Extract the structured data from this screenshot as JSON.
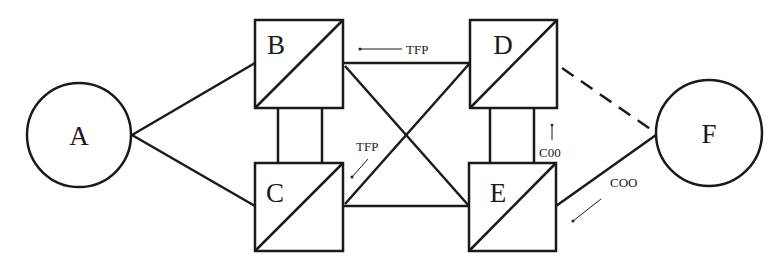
{
  "diagram": {
    "type": "network-topology",
    "nodes": [
      {
        "id": "A",
        "label": "A",
        "shape": "circle"
      },
      {
        "id": "B",
        "label": "B",
        "shape": "square-diagonal"
      },
      {
        "id": "C",
        "label": "C",
        "shape": "square-diagonal"
      },
      {
        "id": "D",
        "label": "D",
        "shape": "square-diagonal"
      },
      {
        "id": "E",
        "label": "E",
        "shape": "square-diagonal"
      },
      {
        "id": "F",
        "label": "F",
        "shape": "circle"
      }
    ],
    "edges": [
      {
        "from": "A",
        "to": "B",
        "style": "solid"
      },
      {
        "from": "A",
        "to": "C",
        "style": "solid"
      },
      {
        "from": "B",
        "to": "C",
        "style": "double-solid"
      },
      {
        "from": "B",
        "to": "D",
        "style": "solid"
      },
      {
        "from": "B",
        "to": "E",
        "style": "solid"
      },
      {
        "from": "C",
        "to": "D",
        "style": "solid"
      },
      {
        "from": "C",
        "to": "E",
        "style": "solid"
      },
      {
        "from": "D",
        "to": "E",
        "style": "double-solid"
      },
      {
        "from": "D",
        "to": "F",
        "style": "dashed"
      },
      {
        "from": "E",
        "to": "F",
        "style": "solid"
      }
    ],
    "annotations": [
      {
        "text": "TFP",
        "arrow": "left",
        "near": "B-D"
      },
      {
        "text": "TFP",
        "arrow": "down-left",
        "near": "C-D"
      },
      {
        "text": "C00",
        "arrow": "up",
        "near": "D-E"
      },
      {
        "text": "COO",
        "arrow": "down-left",
        "near": "E-F"
      }
    ],
    "colors": {
      "stroke": "#1a1a1a",
      "background": "#ffffff"
    }
  }
}
